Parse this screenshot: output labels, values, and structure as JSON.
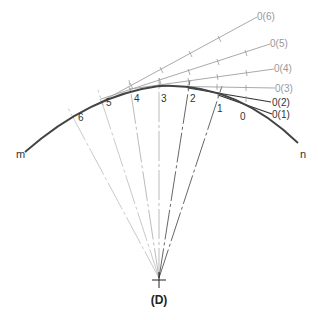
{
  "figure": {
    "caption": "(D)",
    "center": {
      "label": "(D)",
      "x": 159,
      "y": 278
    },
    "curve": {
      "start_label": "m",
      "end_label": "n",
      "color": "#444444"
    },
    "points": [
      {
        "label": "6",
        "x": 73,
        "y": 117
      },
      {
        "label": "5",
        "x": 101,
        "y": 99
      },
      {
        "label": "4",
        "x": 130,
        "y": 89
      },
      {
        "label": "3",
        "x": 159,
        "y": 86
      },
      {
        "label": "2",
        "x": 188,
        "y": 88
      },
      {
        "label": "1",
        "x": 218,
        "y": 95
      },
      {
        "label": "0",
        "x": 244,
        "y": 105
      }
    ],
    "rays": [
      {
        "label": "0(6)",
        "color": "#aaaaaa"
      },
      {
        "label": "0(5)",
        "color": "#aaaaaa"
      },
      {
        "label": "0(4)",
        "color": "#aaaaaa"
      },
      {
        "label": "0(3)",
        "color": "#aaaaaa"
      },
      {
        "label": "0(2)",
        "color": "#333333"
      },
      {
        "label": "0(1)",
        "color": "#333333"
      }
    ]
  }
}
